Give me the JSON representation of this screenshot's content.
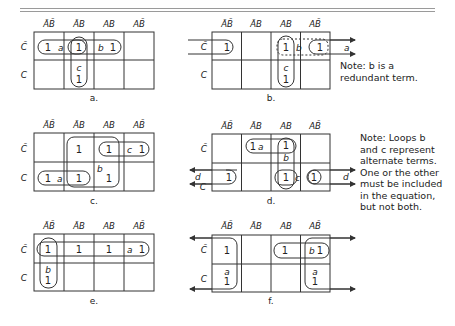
{
  "figure": {
    "column_headers": [
      "ĀB̄",
      "ĀB",
      "AB",
      "AB̄"
    ],
    "row_headers": [
      "C̄",
      "C"
    ],
    "maps": [
      {
        "id": "a",
        "caption": "a.",
        "cells": [
          [
            "1",
            "1",
            "1",
            ""
          ],
          [
            "",
            "1",
            "",
            ""
          ]
        ],
        "loops": [
          {
            "name": "a",
            "cells": "C̄ row, ĀB̄..ĀB"
          },
          {
            "name": "b",
            "cells": "C̄ row, ĀB..AB"
          },
          {
            "name": "c",
            "cells": "ĀB column, C̄..C"
          }
        ]
      },
      {
        "id": "b",
        "caption": "b.",
        "cells": [
          [
            "1",
            "",
            "1",
            "1"
          ],
          [
            "",
            "",
            "1",
            ""
          ]
        ],
        "loops": [
          {
            "name": "a",
            "cells": "C̄ row, ĀB̄ + AB̄ (wrap-around)"
          },
          {
            "name": "b",
            "cells": "C̄ row, AB..AB̄ (dashed)"
          },
          {
            "name": "c",
            "cells": "AB column, C̄..C"
          }
        ],
        "note": "Note: b is a\nredundant term."
      },
      {
        "id": "c",
        "caption": "c.",
        "cells": [
          [
            "",
            "1",
            "1",
            "1"
          ],
          [
            "1",
            "1",
            "1",
            ""
          ]
        ],
        "loops": [
          {
            "name": "a",
            "cells": "C row, ĀB̄..ĀB"
          },
          {
            "name": "b",
            "cells": "ĀB..AB, C̄..C (quad)"
          },
          {
            "name": "c",
            "cells": "C̄ row, AB..AB̄"
          }
        ]
      },
      {
        "id": "d",
        "caption": "d.",
        "cells": [
          [
            "",
            "1",
            "1",
            ""
          ],
          [
            "1",
            "",
            "1",
            "1"
          ]
        ],
        "loops": [
          {
            "name": "a",
            "cells": "C̄ row, ĀB..AB"
          },
          {
            "name": "b",
            "cells": "AB column, C̄..C"
          },
          {
            "name": "c",
            "cells": "C row, AB..AB̄"
          },
          {
            "name": "d",
            "cells": "C row, ĀB̄ + AB̄ (wrap-around)"
          }
        ],
        "note": "Note: Loops b\nand c represent\nalternate terms.\nOne or the other\nmust be included\nin the equation,\nbut not both."
      },
      {
        "id": "e",
        "caption": "e.",
        "cells": [
          [
            "1",
            "1",
            "1",
            "1"
          ],
          [
            "1",
            "",
            "",
            ""
          ]
        ],
        "loops": [
          {
            "name": "a",
            "cells": "C̄ row, all four columns"
          },
          {
            "name": "b",
            "cells": "ĀB̄ column, C̄..C"
          }
        ]
      },
      {
        "id": "f",
        "caption": "f.",
        "cells": [
          [
            "1",
            "",
            "1",
            "1"
          ],
          [
            "1",
            "",
            "",
            "1"
          ]
        ],
        "loops": [
          {
            "name": "a",
            "cells": "ĀB̄ + AB̄ columns, C̄..C (wrap-around quad)"
          },
          {
            "name": "b",
            "cells": "C̄ row, AB..AB̄"
          }
        ]
      }
    ],
    "labels": {
      "a": "a",
      "b": "b",
      "c": "c",
      "d": "d"
    }
  }
}
